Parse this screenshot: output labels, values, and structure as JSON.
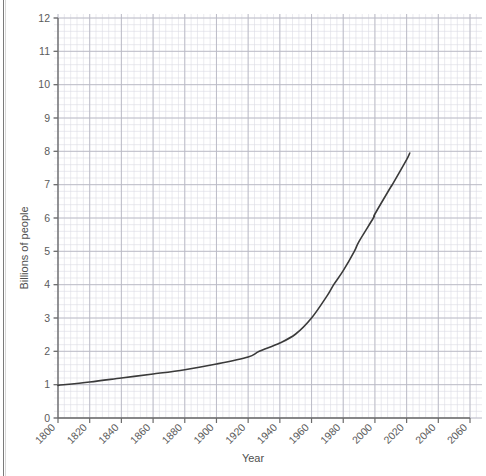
{
  "chart_data": {
    "type": "line",
    "title": "",
    "xlabel": "Year",
    "ylabel": "Billions of people",
    "xlim": [
      1800,
      2060
    ],
    "ylim": [
      0,
      12
    ],
    "xticks": [
      1800,
      1820,
      1840,
      1860,
      1880,
      1900,
      1920,
      1940,
      1960,
      1980,
      2000,
      2020,
      2040,
      2060
    ],
    "xtick_labels": [
      "1800",
      "1820",
      "1840",
      "1860",
      "1880",
      "1900",
      "1920",
      "1940",
      "1960",
      "1980",
      "2000",
      "2020",
      "2040",
      "2060"
    ],
    "yticks": [
      0,
      1,
      2,
      3,
      4,
      5,
      6,
      7,
      8,
      9,
      10,
      11,
      12
    ],
    "ytick_labels": [
      "0",
      "1",
      "2",
      "3",
      "4",
      "5",
      "6",
      "7",
      "8",
      "9",
      "10",
      "11",
      "12"
    ],
    "grid": true,
    "minor_grid": true,
    "minor_grid_divisions": 5,
    "legend": "none",
    "series": [
      {
        "name": "World population",
        "color": "#3a3a3a",
        "x": [
          1800,
          1820,
          1840,
          1860,
          1880,
          1900,
          1920,
          1927,
          1940,
          1950,
          1960,
          1970,
          1974,
          1980,
          1987,
          1990,
          1999,
          2000,
          2010,
          2011,
          2020,
          2022
        ],
        "y": [
          0.98,
          1.08,
          1.2,
          1.32,
          1.45,
          1.62,
          1.83,
          2.0,
          2.25,
          2.52,
          3.0,
          3.68,
          4.0,
          4.42,
          5.0,
          5.3,
          6.0,
          6.12,
          6.93,
          7.0,
          7.75,
          7.95
        ]
      }
    ],
    "annotations": [],
    "axis_color": "#6b6b6b",
    "grid_major_color": "#b9b9c4",
    "grid_minor_color": "#dcdce4"
  },
  "labels": {
    "x_axis_title": "Year",
    "y_axis_title": "Billions of people"
  }
}
